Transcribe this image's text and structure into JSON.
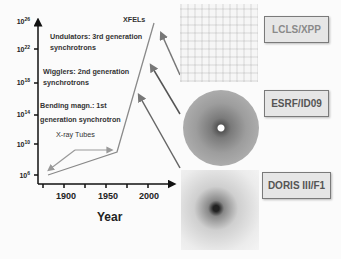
{
  "figure": {
    "y_axis": {
      "ticks": [
        {
          "base": "10",
          "exp": "26"
        },
        {
          "base": "10",
          "exp": "22"
        },
        {
          "base": "10",
          "exp": "18"
        },
        {
          "base": "10",
          "exp": "14"
        },
        {
          "base": "10",
          "exp": "10"
        },
        {
          "base": "10",
          "exp": "6"
        }
      ]
    },
    "x_axis": {
      "label": "Year",
      "ticks": [
        "1900",
        "1950",
        "2000"
      ]
    },
    "annotations": {
      "xfels": "XFELs",
      "undulators_line1": "Undulators: 3rd generation",
      "undulators_line2": "synchrotrons",
      "wigglers_line1": "Wigglers: 2nd generation",
      "wigglers_line2": "synchrotrons",
      "bending_line1": "Bending magn.: 1st",
      "bending_line2": "generation synchrotron",
      "xray_tubes": "X-ray Tubes"
    },
    "sources": [
      {
        "label": "LCLS/XPP",
        "pattern": "lcls-diffraction-pattern"
      },
      {
        "label": "ESRF/ID09",
        "pattern": "esrf-diffraction-pattern"
      },
      {
        "label": "DORIS III/F1",
        "pattern": "doris-diffraction-pattern"
      }
    ],
    "colors": {
      "axis": "#111111",
      "curve": "#8a8a8a",
      "arrows": "#6e6e6e",
      "box_fill": "#e6e6e6",
      "box_border": "#7a7a7a"
    }
  }
}
